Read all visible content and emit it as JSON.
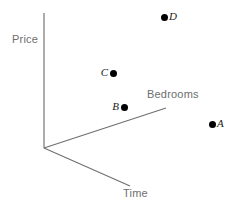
{
  "chart_data": {
    "type": "scatter",
    "title": "",
    "projection": "3d-axes-sketch",
    "axes": [
      {
        "name": "Price",
        "label": "Price",
        "direction": "up",
        "label_position": {
          "x": 12,
          "y": 33
        },
        "line": {
          "x1": 44,
          "y1": 13,
          "x2": 44,
          "y2": 148
        }
      },
      {
        "name": "Bedrooms",
        "label": "Bedrooms",
        "direction": "upper-right",
        "label_position": {
          "x": 147,
          "y": 88
        },
        "line": {
          "x1": 44,
          "y1": 148,
          "x2": 166,
          "y2": 108
        }
      },
      {
        "name": "Time",
        "label": "Time",
        "direction": "lower-right",
        "label_position": {
          "x": 123,
          "y": 187
        },
        "line": {
          "x1": 44,
          "y1": 148,
          "x2": 130,
          "y2": 186
        }
      }
    ],
    "axis_color": "#808080",
    "axis_label_color": "#6e6e6e",
    "point_color": "#000000",
    "points": [
      {
        "label": "A",
        "x": 212,
        "y": 124,
        "label_side": "right"
      },
      {
        "label": "B",
        "x": 124,
        "y": 107,
        "label_side": "left"
      },
      {
        "label": "C",
        "x": 113,
        "y": 73,
        "label_side": "left"
      },
      {
        "label": "D",
        "x": 164,
        "y": 17,
        "label_side": "right"
      }
    ],
    "xlabel": "Bedrooms",
    "ylabel": "Price",
    "zlabel": "Time",
    "grid": false,
    "legend": null
  },
  "figure": {
    "axis_labels": {
      "price": "Price",
      "bedrooms": "Bedrooms",
      "time": "Time"
    },
    "point_labels": {
      "a": "A",
      "b": "B",
      "c": "C",
      "d": "D"
    }
  }
}
